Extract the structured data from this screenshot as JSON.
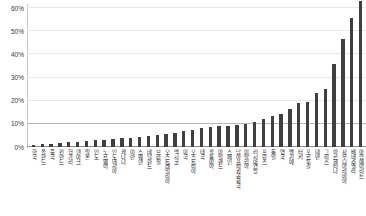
{
  "chart_data": {
    "type": "bar",
    "title": "",
    "subtitle": "",
    "xlabel": "",
    "ylabel": "",
    "ylim": [
      0,
      60
    ],
    "ytick_labels": [
      "0%",
      "10%",
      "20%",
      "30%",
      "40%",
      "50%",
      "60%"
    ],
    "ytick_values": [
      0,
      10,
      20,
      30,
      40,
      50,
      60
    ],
    "grid": true,
    "legend": false,
    "bar_color": "#3f3f3f",
    "gridline_color": "#e8e8e8",
    "major_gridline_color": "#b8b8b8",
    "axis_color": "#8e8e8e",
    "categories": [
      "한국",
      "폴란드",
      "중국",
      "핀란드",
      "헝가리",
      "덴마크",
      "일본",
      "인도",
      "노르웨이",
      "인도네시아",
      "캐나다",
      "이란",
      "스웨덴",
      "네덜란드",
      "브라질",
      "오스트레일리아",
      "멕시코",
      "미국",
      "오스트리아",
      "태국",
      "콜롬비아",
      "아일랜드",
      "스페인",
      "남아프리카공화국",
      "이탈리아",
      "러시아연방",
      "프랑스",
      "독일",
      "영국",
      "벨기에",
      "터키",
      "포르투갈",
      "대만",
      "그리스",
      "아르헨티나",
      "사우디아라비아",
      "베네수엘라",
      "아랍에미리트"
    ],
    "values": [
      0.8,
      1.1,
      1.4,
      1.7,
      2.0,
      2.3,
      2.6,
      2.9,
      3.2,
      3.5,
      3.8,
      4.1,
      4.4,
      4.8,
      5.2,
      5.6,
      6.2,
      6.8,
      7.4,
      8.1,
      8.6,
      9.0,
      9.2,
      9.4,
      10.0,
      11.0,
      12.2,
      13.4,
      14.4,
      16.4,
      19.0,
      19.6,
      23.4,
      25.0,
      35.8,
      46.8,
      55.6,
      63.0
    ]
  }
}
